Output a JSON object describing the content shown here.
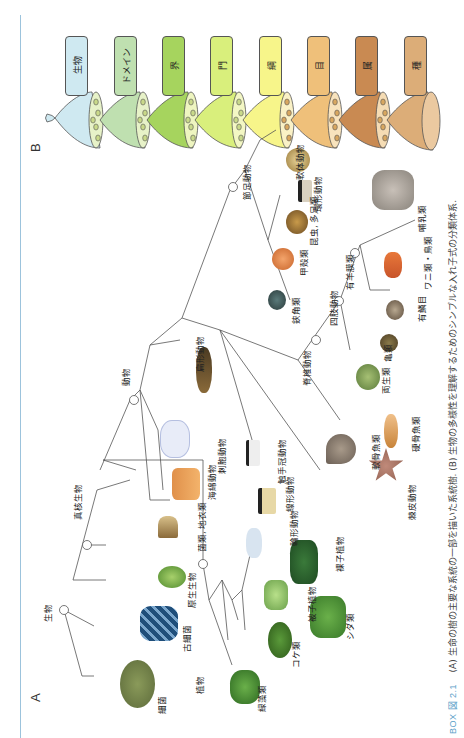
{
  "figure": {
    "id": "BOX 図 2.1",
    "caption_line1": "(A) 生命の樹の主要な系統の一部を描いた系統樹. (B) 生物の多様性を理解するためのシンプルな入れ子式の分類体系.",
    "panel_a_label": "A",
    "panel_b_label": "B"
  },
  "panel_b": {
    "ranks": [
      {
        "label": "生物",
        "color": "#cfe9f1"
      },
      {
        "label": "ドメイン",
        "color": "#bfe0b0"
      },
      {
        "label": "界",
        "color": "#a6d45e"
      },
      {
        "label": "門",
        "color": "#d9ef7c"
      },
      {
        "label": "綱",
        "color": "#f7f58a"
      },
      {
        "label": "目",
        "color": "#efc07a"
      },
      {
        "label": "属",
        "color": "#c98a52"
      },
      {
        "label": "種",
        "color": "#dcad78"
      }
    ]
  },
  "panel_a": {
    "nodes": {
      "life": "生物",
      "eukaryotes": "真核生物",
      "plants": "植物",
      "animals": "動物",
      "arthropods": "節足動物",
      "vertebrates": "脊椎動物",
      "tetrapods": "四肢動物",
      "amniotes": "有羊膜類"
    },
    "taxa": {
      "bacteria": "細菌",
      "archaea": "古細菌",
      "protists": "原生生物",
      "fungi": "菌類, 地衣類",
      "sponges": "海綿動物",
      "cnidarians": "刺胞動物",
      "flatworms": "扁形動物",
      "lophophorates": "触手冠動物",
      "nematodes": "線形動物",
      "rotifers": "輪形動物",
      "chelicerates": "鋏角類",
      "crustaceans": "甲殻類",
      "insects": "昆虫, 多足類",
      "annelids": "環形動物",
      "molluscs": "軟体動物",
      "echinoderms": "棘皮動物",
      "cartilaginous_fish": "軟骨魚類",
      "bony_fish": "硬骨魚類",
      "amphibians": "両生類",
      "turtles": "亀類",
      "squamates": "有鱗目",
      "crocs_birds": "ワニ類・鳥類",
      "mammals": "哺乳類",
      "green_algae": "緑藻類",
      "mosses": "コケ類",
      "ferns": "シダ類",
      "angiosperms": "被子植物",
      "gymnosperms": "裸子植物"
    }
  }
}
